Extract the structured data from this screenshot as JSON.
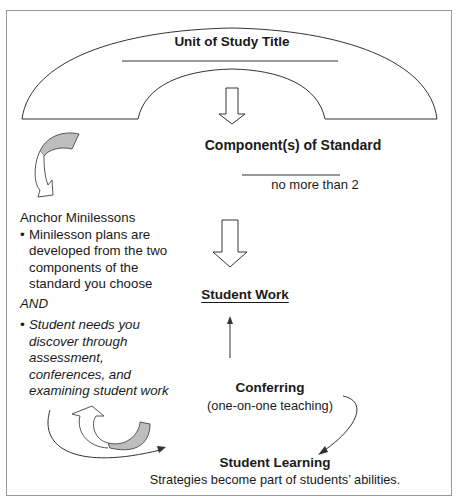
{
  "diagram": {
    "unit_title": {
      "label": "Unit of Study Title",
      "input_line": ""
    },
    "components": {
      "label": "Component(s) of Standard",
      "note": "no more than 2"
    },
    "anchor_minilessons": {
      "heading": "Anchor Minilessons",
      "bullet1": "Minilesson plans are developed from the two components of the standard you choose",
      "connector": "AND",
      "bullet2": "Student needs you discover through assessment, conferences, and examining student work"
    },
    "student_work": {
      "label": "Student Work"
    },
    "conferring": {
      "label": "Conferring",
      "sublabel": "(one-on-one teaching)"
    },
    "student_learning": {
      "label": "Student Learning",
      "sublabel": "Strategies become part of students’ abilities."
    },
    "arrows": [
      {
        "from": "unit_title",
        "to": "components",
        "style": "hollow-block-down"
      },
      {
        "from": "components",
        "to": "student_work",
        "style": "hollow-block-down"
      },
      {
        "from": "conferring",
        "to": "student_work",
        "style": "thin-up"
      },
      {
        "from": "conferring",
        "to": "student_learning",
        "style": "thin-curved"
      },
      {
        "from": "anchor_minilessons",
        "to": "student_learning",
        "style": "thin-curved"
      },
      {
        "from": "student_learning",
        "to": "anchor_minilessons",
        "style": "curled-ribbon-loop"
      },
      {
        "from": "components",
        "to": "anchor_minilessons",
        "style": "curled-ribbon-down"
      }
    ],
    "colors": {
      "line": "#333333",
      "ribbon_fill": "#bdbdbd",
      "frame": "#9a9a9a"
    }
  }
}
